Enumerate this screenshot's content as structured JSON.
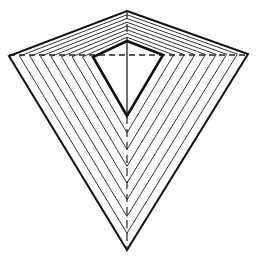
{
  "diagram": {
    "type": "nested-kites-line-drawing",
    "stroke_color": "#111111",
    "background": "#ffffff",
    "outer_kite": {
      "top": [
        127,
        11
      ],
      "left": [
        9,
        56
      ],
      "right": [
        248,
        54
      ],
      "bottom": [
        127,
        250
      ]
    },
    "inner_kite": {
      "top": [
        127,
        41
      ],
      "left": [
        93,
        57
      ],
      "right": [
        163,
        55
      ],
      "bottom": [
        127,
        116
      ]
    },
    "intermediate_count": 7,
    "horizontal_dashed_line_y": 55,
    "vertical_axis_x": 127
  }
}
